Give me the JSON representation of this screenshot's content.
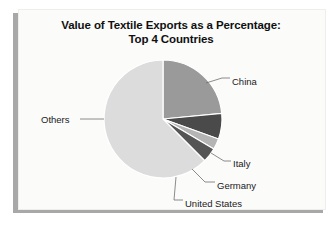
{
  "chart_data": {
    "type": "pie",
    "title": "Value of Textile Exports as a Percentage: Top 4 Countries",
    "title_line1": "Value of Textile Exports as a Percentage:",
    "title_line2": "Top 4 Countries",
    "xlabel": "",
    "ylabel": "",
    "legend_position": "none",
    "grid": false,
    "labels_outside": true,
    "start_angle_deg": 0,
    "direction": "clockwise",
    "categories": [
      "China",
      "Italy",
      "Germany",
      "United States",
      "Others"
    ],
    "values": [
      23.5,
      7.0,
      3.0,
      4.0,
      62.5
    ],
    "unit": "percent",
    "slices": [
      {
        "label": "China",
        "value": 23.5,
        "color": "#9a9a9a",
        "start_deg": 0.0,
        "end_deg": 84.6
      },
      {
        "label": "Italy",
        "value": 7.0,
        "color": "#4a4a4a",
        "start_deg": 84.6,
        "end_deg": 109.8
      },
      {
        "label": "Germany",
        "value": 3.0,
        "color": "#b4b4b4",
        "start_deg": 109.8,
        "end_deg": 120.6
      },
      {
        "label": "United States",
        "value": 4.0,
        "color": "#555555",
        "start_deg": 120.6,
        "end_deg": 135.0
      },
      {
        "label": "Others",
        "value": 62.5,
        "color": "#dcdcdc",
        "start_deg": 135.0,
        "end_deg": 360.0
      }
    ]
  },
  "chart": {
    "title_line1": "Value of Textile Exports as a Percentage:",
    "title_line2": "Top 4 Countries",
    "labels": {
      "china": "China",
      "italy": "Italy",
      "germany": "Germany",
      "united_states": "United States",
      "others": "Others"
    }
  },
  "colors": {
    "china": "#9a9a9a",
    "italy": "#4a4a4a",
    "germany": "#b4b4b4",
    "united_states": "#555555",
    "others": "#dcdcdc",
    "panel_background": "#fbfbfa",
    "shadow": "#a8a8a8",
    "text": "#101010",
    "leader_line": "#6e6e6e"
  }
}
